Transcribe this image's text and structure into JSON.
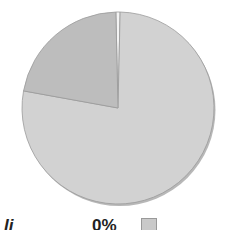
{
  "chart_data": {
    "type": "pie",
    "title": "",
    "slices": [
      {
        "label": "",
        "value": 77.5,
        "color": "#d2d2d2"
      },
      {
        "label": "",
        "value": 21.8,
        "color": "#bdbdbd"
      },
      {
        "label": "",
        "value": 0.7,
        "color": "#f4f4f4"
      }
    ],
    "legend": {
      "visible_text": [
        "li",
        "0%"
      ],
      "position": "bottom"
    }
  },
  "legend": {
    "partial_label": "li",
    "partial_percent": "0%"
  },
  "colors": {
    "border": "#9a9a9a"
  }
}
